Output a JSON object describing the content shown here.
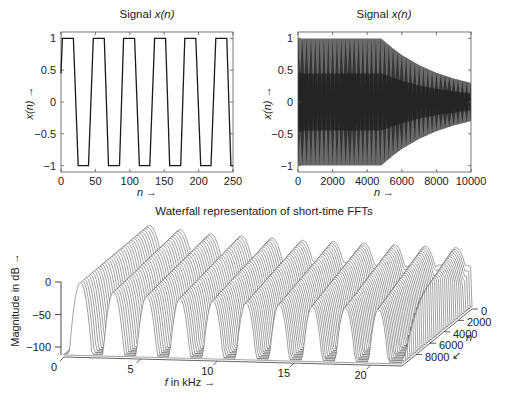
{
  "chart_data": [
    {
      "type": "line",
      "title": "Signal x(n)",
      "title_prefix": "Signal ",
      "title_var": "x(n)",
      "xlabel": "n →",
      "ylabel": "x(n) →",
      "xlim": [
        0,
        250
      ],
      "ylim": [
        -1.1,
        1.1
      ],
      "xticks": [
        0,
        50,
        100,
        150,
        200,
        250
      ],
      "yticks": [
        -1,
        -0.5,
        0,
        0.5,
        1
      ],
      "ytick_labels": [
        "−1",
        "−0.5",
        "0",
        "0.5",
        "1"
      ],
      "grid": false,
      "series": [
        {
          "name": "x(n)",
          "description": "clipped sinusoid (trapezoidal wave), period ~44.5 samples, amplitude ±1, starts near 0.45 at n=0",
          "x": [
            0,
            2,
            3,
            18,
            25,
            40,
            47,
            63,
            69,
            85,
            91,
            107,
            114,
            129,
            136,
            152,
            158,
            174,
            180,
            196,
            203,
            218,
            225,
            241,
            247,
            250
          ],
          "values": [
            0.45,
            1,
            1,
            1,
            -1,
            -1,
            1,
            1,
            -1,
            -1,
            1,
            1,
            -1,
            -1,
            1,
            1,
            -1,
            -1,
            1,
            1,
            -1,
            -1,
            1,
            1,
            -1,
            -1
          ]
        }
      ]
    },
    {
      "type": "line",
      "title": "Signal x(n)",
      "title_prefix": "Signal ",
      "title_var": "x(n)",
      "xlabel": "n →",
      "ylabel": "x(n) →",
      "xlim": [
        0,
        10000
      ],
      "ylim": [
        -1.1,
        1.1
      ],
      "xticks": [
        0,
        2000,
        4000,
        6000,
        8000,
        10000
      ],
      "yticks": [
        -1,
        -0.5,
        0,
        0.5,
        1
      ],
      "ytick_labels": [
        "−1",
        "−0.5",
        "0",
        "0.5",
        "1"
      ],
      "grid": false,
      "series": [
        {
          "name": "x(n) envelope",
          "description": "dense oscillating signal filling ±1 up to n≈4800, then envelope decays to ±0.3 at n=10000",
          "x": [
            0,
            4800,
            5500,
            6000,
            7000,
            8000,
            9000,
            10000
          ],
          "envelope": [
            1,
            1,
            0.84,
            0.74,
            0.58,
            0.46,
            0.37,
            0.3
          ]
        }
      ]
    },
    {
      "type": "waterfall",
      "title": "Waterfall representation of short-time FFTs",
      "xlabel": "f in kHz →",
      "xlabel_var": "f",
      "xlabel_rest": " in kHz →",
      "ylabel": "n",
      "zlabel": "Magnitude in dB →",
      "xlim": [
        0,
        22.05
      ],
      "ylim": [
        0,
        10000
      ],
      "zlim": [
        -110,
        0
      ],
      "xticks": [
        0,
        5,
        10,
        15,
        20
      ],
      "yticks": [
        0,
        2000,
        4000,
        6000,
        8000
      ],
      "zticks": [
        0,
        -50,
        -100
      ],
      "ztick_labels": [
        "0",
        "−50",
        "−100"
      ],
      "n_traces": 36,
      "series": [
        {
          "name": "spectral peaks (odd harmonics)",
          "peak_freqs_khz": [
            1,
            3,
            5,
            7,
            9,
            11,
            13,
            15,
            17,
            19,
            21
          ],
          "peak_levels_db": [
            0,
            -5,
            -10,
            -12,
            -14,
            -16,
            -17,
            -18,
            -19,
            -20,
            -21
          ]
        }
      ]
    }
  ],
  "labels": {
    "plot1_title_prefix": "Signal ",
    "plot1_title_var": "x(n)",
    "plot2_title_prefix": "Signal ",
    "plot2_title_var": "x(n)",
    "plot1_xlabel": "n →",
    "plot2_xlabel": "n →",
    "plot1_ylabel": "x(n) →",
    "plot2_ylabel": "x(n) →",
    "waterfall_title": "Waterfall representation of short-time FFTs",
    "waterfall_zlabel": "Magnitude in dB →",
    "waterfall_xlabel_var": "f",
    "waterfall_xlabel_rest": " in kHz →",
    "waterfall_ylabel": "n",
    "waterfall_arrow": "↙"
  },
  "colors": {
    "line": "#1a1a1a",
    "axis": "#333333",
    "fill_dark": "#2a2a2a",
    "fill_light": "#6a6a6a",
    "trace": "#555555",
    "background": "#ffffff"
  }
}
